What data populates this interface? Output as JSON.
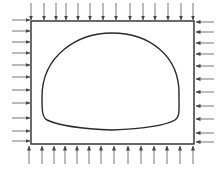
{
  "diagram": {
    "type": "tunnel-cross-section-with-boundary-loads",
    "colors": {
      "background": "#ffffff",
      "stroke": "#2b2b2b",
      "arrow": "#555555"
    },
    "boundary_box": {
      "x": 31,
      "y": 21,
      "width": 163,
      "height": 123
    },
    "tunnel_outline": {
      "top": [
        112,
        33
      ],
      "left_extreme": [
        42,
        97
      ],
      "left_bottom_corner": [
        47,
        120
      ],
      "bottom_center": [
        112,
        130
      ],
      "right_bottom_corner": [
        175,
        120
      ],
      "right_extreme": [
        179,
        95
      ]
    },
    "loads": {
      "top": {
        "direction": "down",
        "count": 14,
        "x": [
          31,
          44,
          56,
          66,
          78,
          90,
          103,
          116,
          130,
          143,
          155,
          168,
          181,
          193
        ],
        "y_from": 3,
        "y_to": 20
      },
      "bottom": {
        "direction": "up",
        "count": 14,
        "x": [
          29,
          42,
          54,
          65,
          77,
          89,
          101,
          114,
          128,
          141,
          154,
          167,
          180,
          193
        ],
        "y_from": 164,
        "y_to": 146
      },
      "left": {
        "direction": "right",
        "count": 11,
        "y": [
          20,
          31,
          42,
          53,
          65,
          77,
          90,
          103,
          118,
          131,
          141
        ],
        "x_from": 12,
        "x_to": 30
      },
      "right": {
        "direction": "left",
        "count": 11,
        "y": [
          22,
          32,
          43,
          54,
          66,
          79,
          92,
          106,
          119,
          133,
          142
        ],
        "x_from": 214,
        "x_to": 196
      }
    }
  }
}
